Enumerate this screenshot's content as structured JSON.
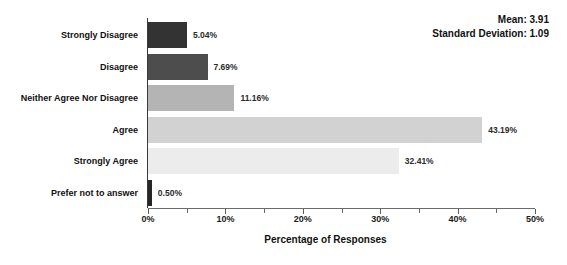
{
  "chart_data": {
    "type": "bar",
    "orientation": "horizontal",
    "title": "",
    "xlabel": "Percentage of Responses",
    "ylabel": "",
    "xlim": [
      0,
      50
    ],
    "grid": false,
    "legend": null,
    "tick_labels": [
      "0%",
      "10%",
      "20%",
      "30%",
      "40%",
      "50%"
    ],
    "tick_values": [
      0,
      10,
      20,
      30,
      40,
      50
    ],
    "minor_tick_values": [
      5,
      15,
      25,
      35,
      45
    ],
    "categories": [
      "Strongly Disagree",
      "Disagree",
      "Neither Agree Nor Disagree",
      "Agree",
      "Strongly Agree",
      "Prefer not to answer"
    ],
    "values": [
      5.04,
      7.69,
      11.16,
      43.19,
      32.41,
      0.5
    ],
    "value_labels": [
      "5.04%",
      "7.69%",
      "11.16%",
      "43.19%",
      "32.41%",
      "0.50%"
    ],
    "bar_colors": [
      "#333333",
      "#4d4d4d",
      "#b4b4b4",
      "#d2d2d2",
      "#ececec",
      "#262626"
    ],
    "annotations": {
      "mean_label": "Mean: 3.91",
      "std_label": "Standard Deviation: 1.09"
    }
  }
}
